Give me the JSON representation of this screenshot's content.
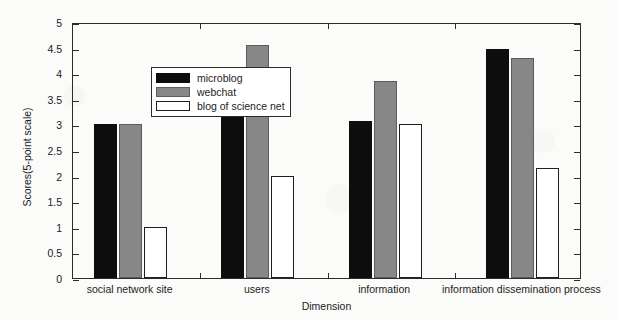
{
  "chart_data": {
    "type": "bar",
    "title": "",
    "xlabel": "Dimension",
    "ylabel": "Scores(5-point scale)",
    "ylim": [
      0,
      5
    ],
    "yticks": [
      0,
      0.5,
      1,
      1.5,
      2,
      2.5,
      3,
      3.5,
      4,
      4.5,
      5
    ],
    "ytick_labels": [
      "0",
      "0.5",
      "1",
      "1.5",
      "2",
      "2.5",
      "3",
      "3.5",
      "4",
      "4.5",
      "5"
    ],
    "grid": false,
    "legend_position": "upper-left-inside",
    "categories": [
      "social network site",
      "users",
      "information",
      "information dissemination process"
    ],
    "series": [
      {
        "name": "microblog",
        "color": "#0d0d0d",
        "values": [
          3.0,
          3.3,
          3.07,
          4.48
        ]
      },
      {
        "name": "webchat",
        "color": "#878787",
        "values": [
          3.0,
          4.55,
          3.85,
          4.3
        ]
      },
      {
        "name": "blog of science net",
        "color": "#ffffff",
        "values": [
          1.0,
          2.0,
          3.0,
          2.15
        ]
      }
    ]
  },
  "figure": {
    "background_color": "#fbfbf9",
    "axis_color": "#2b2b2b",
    "text_color": "#1c1c1c"
  }
}
